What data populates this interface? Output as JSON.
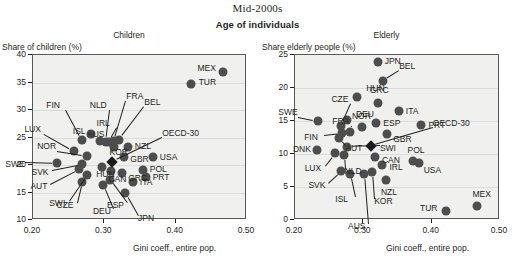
{
  "header": {
    "super_title": "Mid-2000s",
    "group_title": "Age of individuals"
  },
  "chart_data": [
    {
      "id": "children",
      "type": "scatter",
      "title": "Children",
      "ylabel": "Share of children (%)",
      "xlabel": "Gini coeff., entire pop.",
      "xlim": [
        0.2,
        0.5
      ],
      "ylim": [
        10,
        40
      ],
      "xticks": [
        "0.20",
        "0.30",
        "0.40",
        "0.50"
      ],
      "xtick_values": [
        0.2,
        0.3,
        0.4,
        0.5
      ],
      "yticks": [
        "10",
        "15",
        "20",
        "25",
        "30",
        "35",
        "40"
      ],
      "ytick_values": [
        10,
        15,
        20,
        25,
        30,
        35,
        40
      ],
      "grid": true,
      "legend": "none",
      "points": [
        {
          "code": "SWE",
          "x": 0.234,
          "y": 20.4
        },
        {
          "code": "NOR",
          "x": 0.276,
          "y": 21.7
        },
        {
          "code": "FIN",
          "x": 0.269,
          "y": 24.6
        },
        {
          "code": "LUX",
          "x": 0.258,
          "y": 22.6
        },
        {
          "code": "SVK",
          "x": 0.268,
          "y": 20.1
        },
        {
          "code": "AUT",
          "x": 0.265,
          "y": 19.3
        },
        {
          "code": "SWI",
          "x": 0.276,
          "y": 18.1
        },
        {
          "code": "CZE",
          "x": 0.268,
          "y": 16.9
        },
        {
          "code": "DEU",
          "x": 0.298,
          "y": 16.3
        },
        {
          "code": "ISL",
          "x": 0.281,
          "y": 25.6
        },
        {
          "code": "AUS",
          "x": 0.294,
          "y": 24.3
        },
        {
          "code": "NLD",
          "x": 0.302,
          "y": 24.1
        },
        {
          "code": "IRL",
          "x": 0.306,
          "y": 24.2
        },
        {
          "code": "KOR",
          "x": 0.313,
          "y": 23.3
        },
        {
          "code": "HUN",
          "x": 0.297,
          "y": 19.7
        },
        {
          "code": "CAN",
          "x": 0.31,
          "y": 19.0
        },
        {
          "code": "ESP",
          "x": 0.308,
          "y": 17.2
        },
        {
          "code": "GRC",
          "x": 0.325,
          "y": 18.5
        },
        {
          "code": "GBR",
          "x": 0.328,
          "y": 21.5
        },
        {
          "code": "NZL",
          "x": 0.333,
          "y": 23.3
        },
        {
          "code": "BEL",
          "x": 0.321,
          "y": 24.5
        },
        {
          "code": "FRA",
          "x": 0.314,
          "y": 24.4
        },
        {
          "code": "ITA",
          "x": 0.34,
          "y": 16.9
        },
        {
          "code": "JPN",
          "x": 0.329,
          "y": 15.0
        },
        {
          "code": "POL",
          "x": 0.354,
          "y": 19.1
        },
        {
          "code": "PRT",
          "x": 0.358,
          "y": 17.9
        },
        {
          "code": "USA",
          "x": 0.368,
          "y": 21.4
        },
        {
          "code": "TUR",
          "x": 0.421,
          "y": 34.7
        },
        {
          "code": "MEX",
          "x": 0.467,
          "y": 37.0
        },
        {
          "code": "OECD-30",
          "x": 0.311,
          "y": 20.6,
          "marker": "diamond"
        }
      ],
      "labels": [
        {
          "code": "MEX",
          "side": "left"
        },
        {
          "code": "TUR",
          "side": "right"
        },
        {
          "code": "USA",
          "side": "right"
        },
        {
          "code": "POL",
          "side": "right"
        },
        {
          "code": "PRT",
          "side": "right"
        },
        {
          "code": "ITA",
          "side": "right"
        },
        {
          "code": "NZL",
          "side": "right"
        },
        {
          "code": "GBR",
          "side": "right"
        },
        {
          "code": "KOR",
          "side": "right"
        },
        {
          "code": "CAN",
          "side": "right"
        },
        {
          "code": "GRC",
          "side": "right"
        },
        {
          "code": "HUN",
          "side": "right"
        },
        {
          "code": "AUS",
          "side": "below"
        },
        {
          "code": "ISL",
          "side": "left"
        },
        {
          "code": "FIN",
          "side": "leader"
        },
        {
          "code": "LUX",
          "side": "leader"
        },
        {
          "code": "NOR",
          "side": "leader"
        },
        {
          "code": "SWE",
          "side": "leader"
        },
        {
          "code": "SVK",
          "side": "leader"
        },
        {
          "code": "AUT",
          "side": "leader"
        },
        {
          "code": "SWI",
          "side": "leader"
        },
        {
          "code": "CZE",
          "side": "leader"
        },
        {
          "code": "DEU",
          "side": "leader"
        },
        {
          "code": "ESP",
          "side": "leader"
        },
        {
          "code": "JPN",
          "side": "leader"
        },
        {
          "code": "NLD",
          "side": "leader"
        },
        {
          "code": "FRA",
          "side": "leader"
        },
        {
          "code": "BEL",
          "side": "leader"
        },
        {
          "code": "IRL",
          "side": "leader"
        },
        {
          "code": "OECD-30",
          "side": "leader"
        }
      ]
    },
    {
      "id": "elderly",
      "type": "scatter",
      "title": "Elderly",
      "ylabel": "Share elderly people (%)",
      "xlabel": "Gini coeff., entire pop.",
      "xlim": [
        0.2,
        0.5
      ],
      "ylim": [
        0,
        25
      ],
      "xticks": [
        "0.20",
        "0.30",
        "0.40",
        "0.50"
      ],
      "xtick_values": [
        0.2,
        0.3,
        0.4,
        0.5
      ],
      "yticks": [
        "0",
        "5",
        "10",
        "15",
        "20",
        "25"
      ],
      "ytick_values": [
        0,
        5,
        10,
        15,
        20,
        25
      ],
      "grid": true,
      "legend": "none",
      "points": [
        {
          "code": "JPN",
          "x": 0.321,
          "y": 24.0
        },
        {
          "code": "BEL",
          "x": 0.329,
          "y": 21.0
        },
        {
          "code": "HUN",
          "x": 0.291,
          "y": 18.7
        },
        {
          "code": "GRC",
          "x": 0.321,
          "y": 17.8
        },
        {
          "code": "ITA",
          "x": 0.352,
          "y": 16.5
        },
        {
          "code": "NOR",
          "x": 0.276,
          "y": 15.2
        },
        {
          "code": "SWE",
          "x": 0.234,
          "y": 15.0
        },
        {
          "code": "CZE",
          "x": 0.268,
          "y": 14.3
        },
        {
          "code": "ESP",
          "x": 0.319,
          "y": 14.7
        },
        {
          "code": "DEU",
          "x": 0.298,
          "y": 14.1
        },
        {
          "code": "PRT",
          "x": 0.385,
          "y": 14.4
        },
        {
          "code": "FRA",
          "x": 0.281,
          "y": 13.4
        },
        {
          "code": "FIN",
          "x": 0.269,
          "y": 13.2
        },
        {
          "code": "AUT",
          "x": 0.265,
          "y": 12.4
        },
        {
          "code": "GBR",
          "x": 0.335,
          "y": 13.0
        },
        {
          "code": "DNK",
          "x": 0.232,
          "y": 10.6
        },
        {
          "code": "LUX",
          "x": 0.258,
          "y": 10.2
        },
        {
          "code": "NLD",
          "x": 0.271,
          "y": 9.9
        },
        {
          "code": "SWI",
          "x": 0.276,
          "y": 11.0
        },
        {
          "code": "CAN",
          "x": 0.317,
          "y": 9.6
        },
        {
          "code": "POL",
          "x": 0.372,
          "y": 9.0
        },
        {
          "code": "USA",
          "x": 0.381,
          "y": 8.7
        },
        {
          "code": "IRL",
          "x": 0.328,
          "y": 8.4
        },
        {
          "code": "SVK",
          "x": 0.268,
          "y": 7.4
        },
        {
          "code": "ISL",
          "x": 0.281,
          "y": 6.9
        },
        {
          "code": "KOR",
          "x": 0.313,
          "y": 7.3
        },
        {
          "code": "NZL",
          "x": 0.333,
          "y": 6.0
        },
        {
          "code": "AUS",
          "x": 0.301,
          "y": 7.0
        },
        {
          "code": "TUR",
          "x": 0.421,
          "y": 1.4
        },
        {
          "code": "MEX",
          "x": 0.467,
          "y": 2.1
        },
        {
          "code": "OECD-30",
          "x": 0.311,
          "y": 11.2,
          "marker": "diamond"
        }
      ],
      "labels": [
        {
          "code": "JPN",
          "side": "right"
        },
        {
          "code": "BEL",
          "side": "leader"
        },
        {
          "code": "HUN",
          "side": "right"
        },
        {
          "code": "GRC",
          "side": "above"
        },
        {
          "code": "ITA",
          "side": "right"
        },
        {
          "code": "NOR",
          "side": "right"
        },
        {
          "code": "SWE",
          "side": "leader"
        },
        {
          "code": "CZE",
          "side": "leader"
        },
        {
          "code": "ESP",
          "side": "right"
        },
        {
          "code": "DEU",
          "side": "above"
        },
        {
          "code": "PRT",
          "side": "right"
        },
        {
          "code": "FRA",
          "side": "leader"
        },
        {
          "code": "FIN",
          "side": "leader"
        },
        {
          "code": "AUT",
          "side": "leader"
        },
        {
          "code": "GBR",
          "side": "right"
        },
        {
          "code": "DNK",
          "side": "left"
        },
        {
          "code": "LUX",
          "side": "leader"
        },
        {
          "code": "NLD",
          "side": "leader"
        },
        {
          "code": "SWI",
          "side": "leader"
        },
        {
          "code": "CAN",
          "side": "right"
        },
        {
          "code": "POL",
          "side": "above"
        },
        {
          "code": "USA",
          "side": "right"
        },
        {
          "code": "IRL",
          "side": "right"
        },
        {
          "code": "SVK",
          "side": "leader"
        },
        {
          "code": "ISL",
          "side": "leader"
        },
        {
          "code": "KOR",
          "side": "leader"
        },
        {
          "code": "NZL",
          "side": "below"
        },
        {
          "code": "AUS",
          "side": "leader"
        },
        {
          "code": "TUR",
          "side": "left"
        },
        {
          "code": "MEX",
          "side": "above"
        },
        {
          "code": "OECD-30",
          "side": "leader"
        }
      ]
    }
  ],
  "colors": {
    "plot_background": "#f0f0ee",
    "marker": "#4d4d4d",
    "oecd_marker": "#1a1a1a",
    "axis": "#58595b",
    "text": "#231f20",
    "grid": "#dcdcd8"
  }
}
